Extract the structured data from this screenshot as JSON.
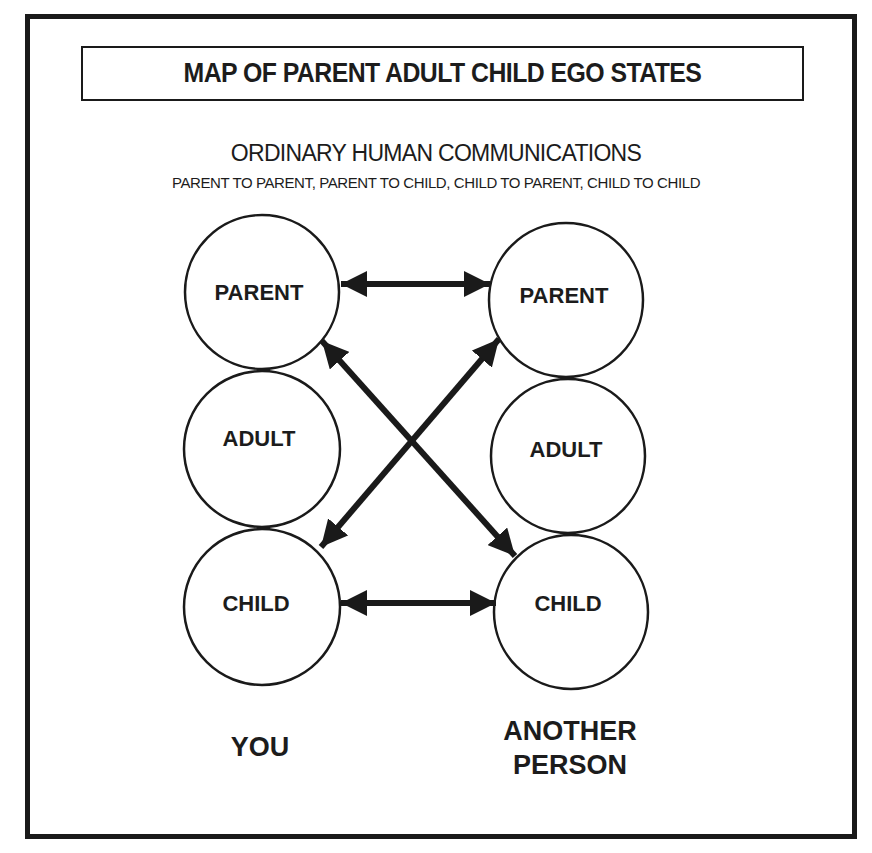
{
  "title": "MAP OF PARENT ADULT CHILD EGO STATES",
  "subtitle": "ORDINARY HUMAN COMMUNICATIONS",
  "subline": "PARENT TO PARENT, PARENT TO CHILD, CHILD TO PARENT, CHILD TO CHILD",
  "parties": {
    "you": {
      "label": "YOU"
    },
    "other": {
      "label_line1": "ANOTHER",
      "label_line2": "PERSON"
    }
  },
  "nodes": {
    "you_parent": {
      "label": "PARENT",
      "cx": 262,
      "cy": 292,
      "r": 77
    },
    "you_adult": {
      "label": "ADULT",
      "cx": 262,
      "cy": 449,
      "r": 78
    },
    "you_child": {
      "label": "CHILD",
      "cx": 262,
      "cy": 607,
      "r": 78
    },
    "other_parent": {
      "label": "PARENT",
      "cx": 566,
      "cy": 300,
      "r": 77
    },
    "other_adult": {
      "label": "ADULT",
      "cx": 568,
      "cy": 456,
      "r": 77
    },
    "other_child": {
      "label": "CHILD",
      "cx": 571,
      "cy": 612,
      "r": 77
    }
  },
  "edges": [
    {
      "from": "you_parent",
      "to": "other_parent",
      "direction": "bidirectional"
    },
    {
      "from": "you_parent",
      "to": "other_child",
      "direction": "bidirectional"
    },
    {
      "from": "you_child",
      "to": "other_parent",
      "direction": "bidirectional"
    },
    {
      "from": "you_child",
      "to": "other_child",
      "direction": "bidirectional"
    }
  ],
  "colors": {
    "ink": "#1a1a1a",
    "background": "#ffffff"
  }
}
